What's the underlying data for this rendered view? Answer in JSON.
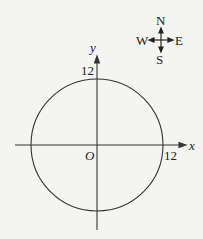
{
  "compass": {
    "north": "N",
    "south": "S",
    "east": "E",
    "west": "W"
  },
  "axes": {
    "x_label": "x",
    "y_label": "y",
    "origin_label": "O"
  },
  "circle": {
    "center": [
      0,
      0
    ],
    "radius": 12
  },
  "ticks": {
    "x_tick": "12",
    "y_tick": "12"
  }
}
